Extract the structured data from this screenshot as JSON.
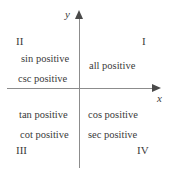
{
  "figure": {
    "type": "coordinate-plane-quadrant-diagram",
    "axes": {
      "x_label": "x",
      "y_label": "y"
    },
    "quadrants": [
      {
        "numeral": "I",
        "functions": [
          "all positive"
        ]
      },
      {
        "numeral": "II",
        "functions": [
          "sin positive",
          "csc positive"
        ]
      },
      {
        "numeral": "III",
        "functions": [
          "tan positive",
          "cot positive"
        ]
      },
      {
        "numeral": "IV",
        "functions": [
          "cos positive",
          "sec positive"
        ]
      }
    ],
    "colors": {
      "text": "#3a3a3a",
      "axis_line": "#8c8c8c",
      "arrow": "#4a4a4a",
      "background": "#ffffff"
    }
  }
}
